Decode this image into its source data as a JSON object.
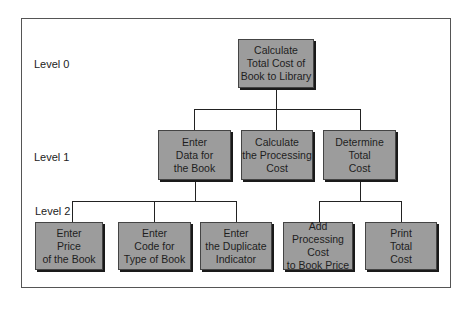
{
  "diagram": {
    "levels": [
      "Level 0",
      "Level 1",
      "Level 2"
    ],
    "level0": {
      "label": "Calculate\nTotal Cost of\nBook to Library"
    },
    "level1": [
      {
        "label": "Enter\nData for\nthe Book"
      },
      {
        "label": "Calculate\nthe Processing\nCost"
      },
      {
        "label": "Determine\nTotal\nCost"
      }
    ],
    "level2": [
      {
        "label": "Enter\nPrice\nof the Book"
      },
      {
        "label": "Enter\nCode for\nType of Book"
      },
      {
        "label": "Enter\nthe Duplicate\nIndicator"
      },
      {
        "label": "Add\nProcessing Cost\nto Book Price"
      },
      {
        "label": "Print\nTotal\nCost"
      }
    ],
    "colors": {
      "box_fill": "#9c9c9c",
      "line": "#222222"
    }
  }
}
